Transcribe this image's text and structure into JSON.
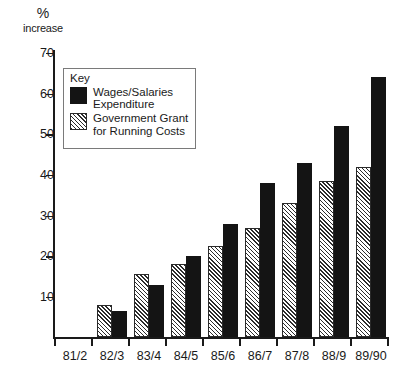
{
  "chart_data": {
    "type": "bar",
    "title": "",
    "xlabel": "",
    "ylabel": "% increase",
    "ylim": [
      0,
      70
    ],
    "grid": false,
    "legend_position": "inside-top-left",
    "categories": [
      "81/2",
      "82/3",
      "83/4",
      "84/5",
      "85/6",
      "86/7",
      "87/8",
      "88/9",
      "89/90"
    ],
    "series": [
      {
        "name": "Government Grant for Running Costs",
        "style": "hatched",
        "values": [
          null,
          8,
          15.5,
          18,
          22.5,
          27,
          33,
          38.5,
          42
        ]
      },
      {
        "name": "Wages/Salaries Expenditure",
        "style": "solid-black",
        "values": [
          null,
          6.5,
          13,
          20,
          28,
          38,
          43,
          52,
          64
        ]
      }
    ],
    "ytick_labels": [
      "70",
      "60",
      "50",
      "40",
      "30",
      "20",
      "10"
    ],
    "ytick_values": [
      70,
      60,
      50,
      40,
      30,
      20,
      10
    ]
  },
  "axis_title": {
    "line1": "%",
    "line2": "increase"
  },
  "legend": {
    "title": "Key",
    "entries": [
      {
        "line1": "Wages/Salaries",
        "line2": "Expenditure"
      },
      {
        "line1": "Government Grant",
        "line2": "for Running Costs"
      }
    ]
  },
  "colors": {
    "black_bar": "#141414",
    "hatch_line": "#2b2b2b",
    "axis": "#1a1a1a",
    "legend_border": "#7a7a7a",
    "background": "#ffffff"
  }
}
